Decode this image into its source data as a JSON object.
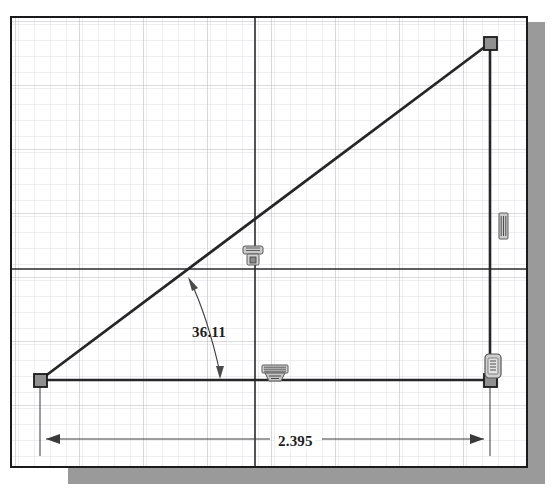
{
  "app": {
    "title": "sketch-canvas",
    "background_color": "#ffffff",
    "frame_color": "#1a1a1a",
    "shadow_color": "#9a9a9a"
  },
  "grid": {
    "minor_color": "#dcdee3",
    "major_color": "#b9bcc4",
    "axis_color": "#2a2a2a",
    "minor_spacing_px": 16,
    "major_every": 4,
    "origin_x_px": 243,
    "origin_y_px": 251
  },
  "sketch": {
    "geometry_color": "#262626",
    "point_fill": "#8f8f8f",
    "point_stroke": "#1a1a1a",
    "entities": [
      {
        "name": "horizontal-line",
        "type": "line",
        "x1": 28,
        "y1": 362,
        "x2": 478,
        "y2": 362
      },
      {
        "name": "vertical-line",
        "type": "line",
        "x1": 478,
        "y1": 362,
        "x2": 478,
        "y2": 25
      },
      {
        "name": "hypotenuse-line",
        "type": "line",
        "x1": 28,
        "y1": 362,
        "x2": 478,
        "y2": 25
      }
    ],
    "points": [
      {
        "name": "origin-point",
        "x": 28,
        "y": 362
      },
      {
        "name": "top-right-point",
        "x": 478,
        "y": 25
      },
      {
        "name": "bottom-right-point",
        "x": 478,
        "y": 362
      }
    ]
  },
  "dimensions": {
    "angle": {
      "name": "angle-dimension",
      "value": "36.11",
      "text_x": 180,
      "text_y": 306,
      "leader_start_x": 178,
      "leader_start_y": 262,
      "leader_end_x": 208,
      "leader_end_y": 361
    },
    "length": {
      "name": "linear-dimension",
      "value": "2.395",
      "text_x": 264,
      "text_y": 415,
      "line_y": 421,
      "left_x": 34,
      "right_x": 478
    }
  },
  "constraints": [
    {
      "name": "perpendicular-constraint-marker",
      "icon": "perpendicular-icon",
      "x": 240,
      "y": 236,
      "width": 24,
      "height": 24
    },
    {
      "name": "horizontal-constraint-marker",
      "icon": "horizontal-icon",
      "x": 250,
      "y": 349,
      "width": 26,
      "height": 17
    },
    {
      "name": "vertical-constraint-marker",
      "icon": "vertical-icon",
      "x": 489,
      "y": 197,
      "width": 12,
      "height": 26
    },
    {
      "name": "coincident-constraint-marker",
      "icon": "coincident-icon",
      "x": 476,
      "y": 337,
      "width": 20,
      "height": 28
    }
  ]
}
